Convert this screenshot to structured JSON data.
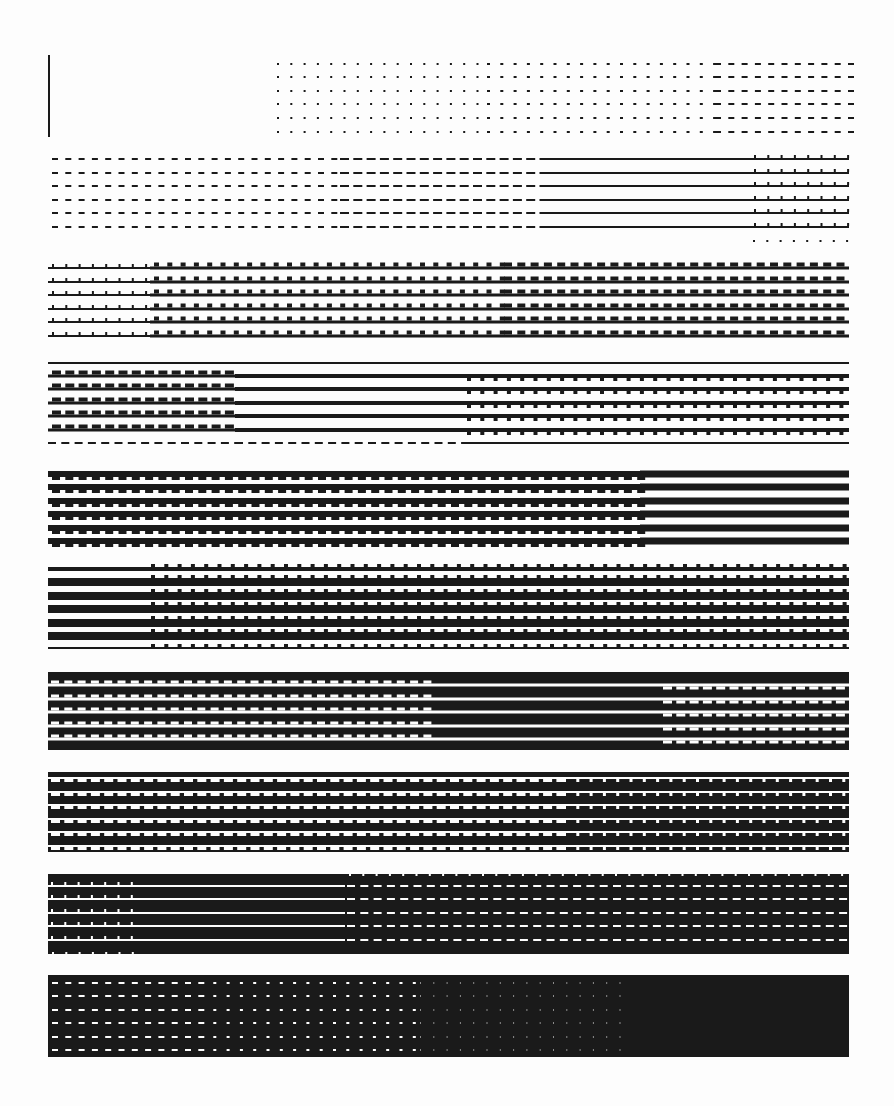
{
  "page": {
    "title": "Halftone line-pattern gray scale test sheet",
    "width": 894,
    "height": 1106,
    "ink_color": "#1a1a1a",
    "paper_color": "#fdfdfd"
  },
  "marker": {
    "x": 49,
    "y1": 55,
    "y2": 137,
    "width": 2
  },
  "x_left": 48,
  "x_right": 849,
  "row_pitch": 13.55,
  "bands": [
    {
      "name": "band-1-lightest",
      "mode": "light",
      "rows": [
        64,
        77,
        91,
        104,
        118,
        132
      ],
      "segments": [
        {
          "x1": 277,
          "x2": 487,
          "type": "dot",
          "pitch": 13.3,
          "len": 2,
          "thick": 2
        },
        {
          "x1": 487,
          "x2": 715,
          "type": "dot",
          "pitch": 13.3,
          "len": 3,
          "thick": 2
        },
        {
          "x1": 715,
          "x2": 849,
          "type": "dash",
          "pitch": 13.3,
          "len": 6,
          "thick": 2
        }
      ]
    },
    {
      "name": "band-2",
      "mode": "light",
      "rows": [
        159,
        173,
        186,
        200,
        213,
        227
      ],
      "segments": [
        {
          "x1": 52,
          "x2": 340,
          "type": "dash",
          "pitch": 13.3,
          "len": 6,
          "thick": 2
        },
        {
          "x1": 340,
          "x2": 548,
          "type": "dash",
          "pitch": 13.3,
          "len": 9,
          "thick": 2
        },
        {
          "x1": 548,
          "x2": 750,
          "type": "solid",
          "thick": 2
        },
        {
          "x1": 750,
          "x2": 849,
          "type": "solid-tick-up",
          "pitch": 13.3,
          "thick": 2,
          "tick": 3
        }
      ],
      "extra_dot_row": {
        "y": 241,
        "x1": 753,
        "x2": 849,
        "pitch": 13.3
      }
    },
    {
      "name": "band-3",
      "mode": "light",
      "rows": [
        268,
        282,
        295,
        309,
        322,
        336
      ],
      "segments": [
        {
          "x1": 48,
          "x2": 150,
          "type": "solid-tick-up",
          "pitch": 13.3,
          "thick": 2,
          "tick": 3
        },
        {
          "x1": 150,
          "x2": 500,
          "type": "solid-tick-up",
          "pitch": 13.3,
          "thick": 3,
          "tick": 4,
          "tickw": 5
        },
        {
          "x1": 500,
          "x2": 849,
          "type": "solid-tick-up",
          "pitch": 13.3,
          "thick": 3,
          "tick": 4,
          "tickw": 8
        }
      ]
    },
    {
      "name": "band-4",
      "mode": "light",
      "rows": [
        363,
        376,
        389,
        403,
        416,
        430,
        443
      ],
      "row_overrides": {
        "0": "thin",
        "6": "dash-then-solid"
      },
      "segments": [
        {
          "x1": 48,
          "x2": 235,
          "type": "solid-tick-up",
          "pitch": 13.3,
          "thick": 3,
          "tick": 4,
          "tickw": 9
        },
        {
          "x1": 235,
          "x2": 463,
          "type": "solid",
          "thick": 4
        },
        {
          "x1": 463,
          "x2": 849,
          "type": "solid-tick-down",
          "pitch": 13.3,
          "thick": 4,
          "tick": 3,
          "tickw": 4
        }
      ]
    },
    {
      "name": "band-5",
      "mode": "light",
      "rows": [
        474,
        487,
        501,
        514,
        528,
        541
      ],
      "segments": [
        {
          "x1": 48,
          "x2": 640,
          "type": "solid-tick-down",
          "pitch": 13.3,
          "thick": 6,
          "tick": 3,
          "tickw": 8
        },
        {
          "x1": 640,
          "x2": 849,
          "type": "solid",
          "thick": 7
        }
      ]
    },
    {
      "name": "band-6",
      "mode": "light",
      "rows": [
        569,
        582,
        596,
        609,
        623,
        636,
        648
      ],
      "row_overrides": {
        "0": "thick4",
        "6": "thin-ticked"
      },
      "segments": [
        {
          "x1": 48,
          "x2": 147,
          "type": "solid",
          "thick": 8
        },
        {
          "x1": 147,
          "x2": 849,
          "type": "solid-tick-up",
          "pitch": 13.3,
          "thick": 8,
          "tick": 3,
          "tickw": 4
        }
      ]
    },
    {
      "name": "band-7",
      "mode": "dark",
      "top": 672,
      "bottom": 750,
      "gaps": [
        685,
        699,
        712,
        726,
        739
      ],
      "segments": [
        {
          "x1": 48,
          "x2": 432,
          "type": "gap-notched",
          "pitch": 13.3,
          "gap": 3,
          "notch": 3,
          "notchw": 8
        },
        {
          "x1": 432,
          "x2": 660,
          "type": "gap-solid",
          "gap": 3
        },
        {
          "x1": 660,
          "x2": 849,
          "type": "gap-notched-down",
          "pitch": 13.3,
          "gap": 3,
          "notch": 3,
          "notchw": 9
        }
      ]
    },
    {
      "name": "band-8",
      "mode": "dark",
      "top": 772,
      "bottom": 852,
      "gaps": [
        778,
        792,
        805,
        819,
        832,
        846
      ],
      "segments": [
        {
          "x1": 48,
          "x2": 560,
          "type": "gap-notched-down",
          "pitch": 13.3,
          "gap": 2,
          "notch": 3,
          "notchw": 9
        },
        {
          "x1": 560,
          "x2": 849,
          "type": "gap-notched-down",
          "pitch": 13.3,
          "gap": 2,
          "notch": 3,
          "notchw": 3
        }
      ]
    },
    {
      "name": "band-9",
      "mode": "dark",
      "top": 874,
      "bottom": 954,
      "gaps": [
        886,
        899,
        913,
        926,
        940
      ],
      "segments": [
        {
          "x1": 48,
          "x2": 144,
          "type": "gap-notched",
          "pitch": 13.3,
          "gap": 2,
          "notch": 3,
          "notchw": 2
        },
        {
          "x1": 144,
          "x2": 345,
          "type": "gap-solid",
          "gap": 2
        },
        {
          "x1": 345,
          "x2": 849,
          "type": "gap-dashed",
          "pitch": 13.3,
          "gap": 2,
          "dashw": 8
        }
      ],
      "top_ticks": {
        "x1": 345,
        "x2": 849,
        "pitch": 13.3
      },
      "bottom_ticks": {
        "x1": 48,
        "x2": 144,
        "pitch": 13.3
      }
    },
    {
      "name": "band-10-darkest",
      "mode": "dark",
      "top": 975,
      "bottom": 1057,
      "gaps": [
        983,
        996,
        1010,
        1023,
        1037,
        1050
      ],
      "segments": [
        {
          "x1": 52,
          "x2": 200,
          "type": "white-dash",
          "pitch": 13.3,
          "len": 6,
          "thick": 2
        },
        {
          "x1": 200,
          "x2": 420,
          "type": "white-dash",
          "pitch": 13.3,
          "len": 3,
          "thick": 2
        },
        {
          "x1": 420,
          "x2": 630,
          "type": "white-dash",
          "pitch": 13.3,
          "len": 1,
          "thick": 1
        },
        {
          "x1": 630,
          "x2": 849,
          "type": "none"
        }
      ]
    }
  ]
}
